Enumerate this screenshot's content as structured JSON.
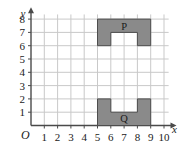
{
  "chart_data": {
    "type": "scatter",
    "title": "",
    "xlabel": "x",
    "ylabel": "y",
    "grid": true,
    "xlim": [
      0,
      10.5
    ],
    "ylim": [
      0,
      8.6
    ],
    "x_ticks": [
      "1",
      "2",
      "3",
      "4",
      "5",
      "6",
      "7",
      "8",
      "9",
      "10"
    ],
    "x_tick_values": [
      1,
      2,
      3,
      4,
      5,
      6,
      7,
      8,
      9,
      10
    ],
    "y_ticks": [
      "1",
      "2",
      "3",
      "4",
      "5",
      "6",
      "7",
      "8"
    ],
    "y_tick_values": [
      1,
      2,
      3,
      4,
      5,
      6,
      7,
      8
    ],
    "origin_label": "O",
    "legend": "none",
    "shapes": [
      {
        "label": "P",
        "fill": "#8a8a8a",
        "stroke": "#4d4d4d",
        "label_x": 7,
        "label_y": 7.45,
        "outline": [
          [
            5,
            8
          ],
          [
            9,
            8
          ],
          [
            9,
            6
          ],
          [
            8,
            6
          ],
          [
            8,
            7
          ],
          [
            6,
            7
          ],
          [
            6,
            6
          ],
          [
            5,
            6
          ]
        ]
      },
      {
        "label": "Q",
        "fill": "#8a8a8a",
        "stroke": "#4d4d4d",
        "label_x": 7,
        "label_y": 0.55,
        "outline": [
          [
            5,
            2
          ],
          [
            6,
            2
          ],
          [
            6,
            1
          ],
          [
            8,
            1
          ],
          [
            8,
            2
          ],
          [
            9,
            2
          ],
          [
            9,
            0
          ],
          [
            5,
            0
          ]
        ]
      }
    ]
  },
  "colors": {
    "grid": "#c9c9c9",
    "axis": "#4a4a4a",
    "shape_fill": "#8a8a8a",
    "shape_stroke": "#4d4d4d",
    "background": "#ffffff",
    "text": "#1a1a1a"
  }
}
